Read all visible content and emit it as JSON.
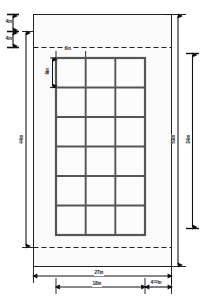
{
  "drawing": {
    "type": "tile-layout-elevation-dimension-drawing",
    "title_visible": false,
    "colors": {
      "background": "#ffffff",
      "wall_fill": "#fafafa",
      "tile_fill": "#fcfcfc",
      "grout_line": "#555555",
      "outline": "#222222",
      "dimension_line": "#111111",
      "dashed_line": "#222222"
    },
    "wall": {
      "name": "wall-outline",
      "fill": "#fafafa"
    },
    "tile_grid": {
      "name": "tile-grid",
      "columns": 3,
      "rows": 6,
      "tile_count": 18,
      "tile_width_label": "6in",
      "tile_height_label": "6in"
    },
    "dashed_guides": {
      "top": "dashed-guide-top",
      "bottom": "dashed-guide-bottom"
    },
    "dimensions": {
      "top_left_first": "4in",
      "top_left_second": "4in",
      "left_vertical": "44in",
      "right_outer_vertical": "53in",
      "right_inner_vertical": "34in",
      "tile_width": "6in",
      "tile_height": "6in",
      "bottom_outer": "27in",
      "bottom_inner": "18in",
      "bottom_right_whole": "4",
      "bottom_right_fraction": "1/2",
      "bottom_right_unit": "in",
      "bottom_right_full": "4 1/2in"
    }
  }
}
